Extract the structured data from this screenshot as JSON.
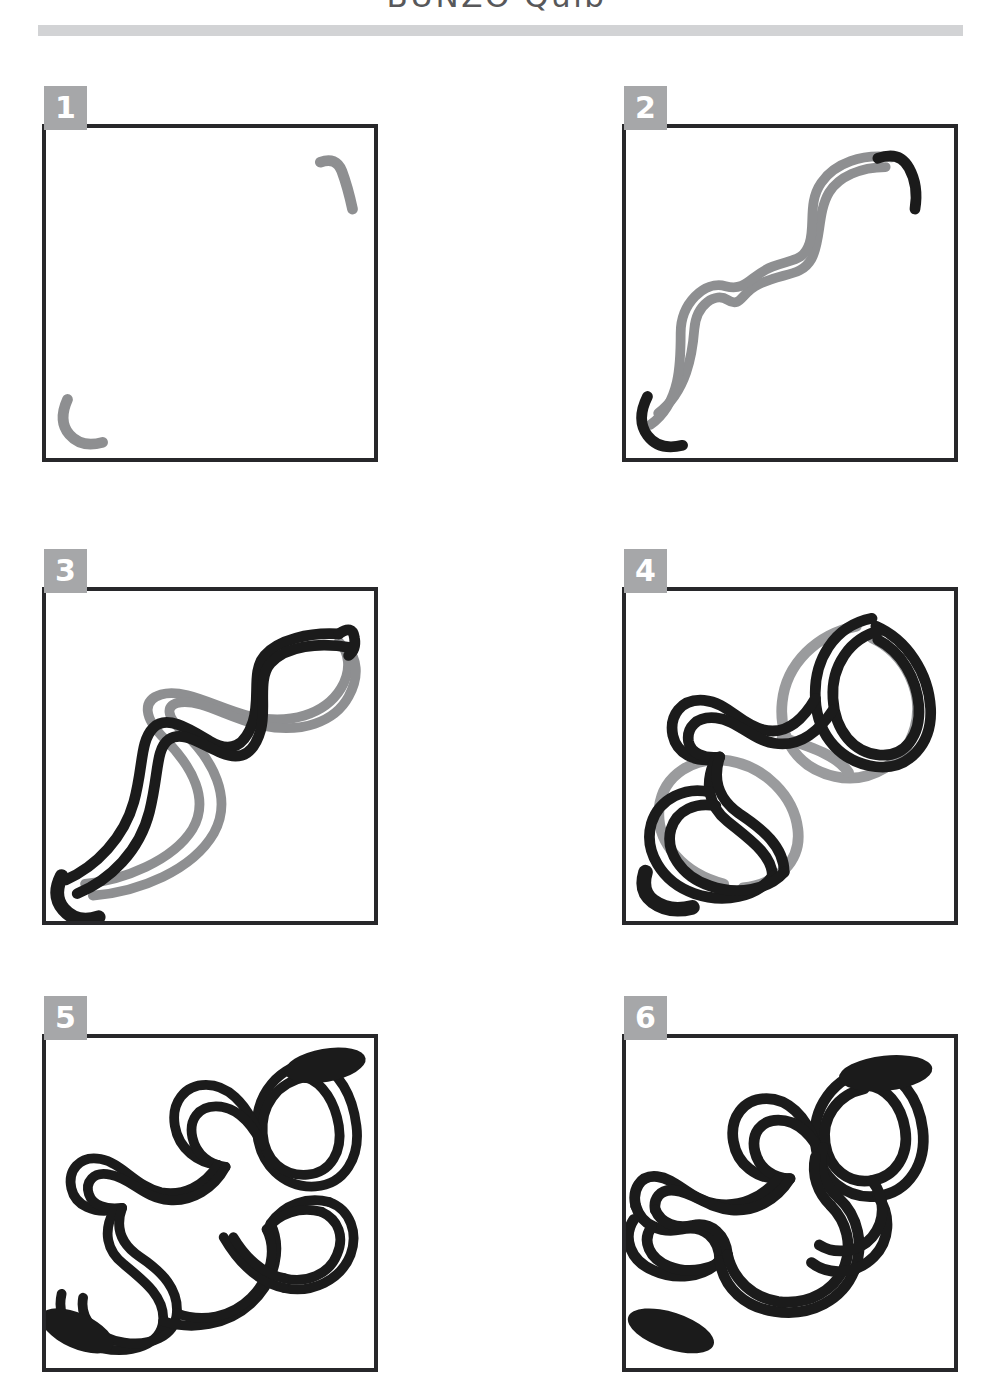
{
  "header": {
    "title": "BUNZO Quib",
    "rule_color": "#d2d3d5",
    "title_color": "#58585a"
  },
  "palette": {
    "ink_black": "#1b1b1b",
    "guide_gray": "#8e8f91",
    "badge_gray": "#a6a7a9",
    "frame_black": "#27272a",
    "paper_white": "#ffffff"
  },
  "steps": [
    {
      "number": "1",
      "badge_label": "1",
      "caption": "",
      "description": "Empty square frame with two small gray hook marks: one curved hook in the upper-right corner and one C-shaped hook in the lower-left corner.",
      "stroke_colors": [
        "#8e8f91"
      ]
    },
    {
      "number": "2",
      "badge_label": "2",
      "caption": "",
      "description": "A gray double-line S-curve ribbon runs diagonally from the lower-left to the upper-right, capped by solid black hooks at each end.",
      "stroke_colors": [
        "#8e8f91",
        "#1b1b1b"
      ]
    },
    {
      "number": "3",
      "badge_label": "3",
      "caption": "",
      "description": "A black double-line ribbon is drawn weaving over and under the gray guide ribbon, forming a long sinuous band from lower-left to upper-right.",
      "stroke_colors": [
        "#8e8f91",
        "#1b1b1b"
      ]
    },
    {
      "number": "4",
      "badge_label": "4",
      "caption": "",
      "description": "The black ribbon loops back on itself creating rounded lobes at the top-right and bottom-left, overlapping the remaining gray guide lines.",
      "stroke_colors": [
        "#8e8f91",
        "#1b1b1b"
      ]
    },
    {
      "number": "5",
      "badge_label": "5",
      "caption": "",
      "description": "The gray guide is gone. The design is now an all-black interlaced knot of ribbon loops with heavy black blobs at the top-right and bottom-left tips.",
      "stroke_colors": [
        "#1b1b1b"
      ]
    },
    {
      "number": "6",
      "badge_label": "6",
      "caption": "",
      "description": "The finished Bunzo knot: a fully closed woven ribbon pattern with clean over-under crossings and solid black accents at the upper-right and lower-left ends.",
      "stroke_colors": [
        "#1b1b1b"
      ]
    }
  ]
}
